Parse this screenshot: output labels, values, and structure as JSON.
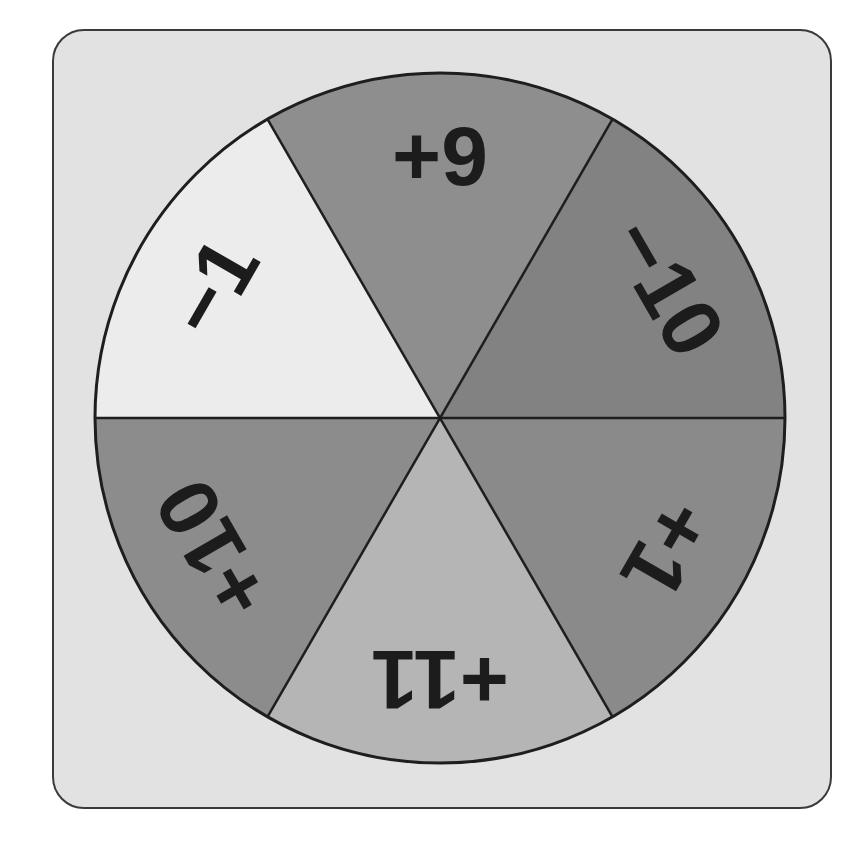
{
  "spinner": {
    "center": {
      "x": 440,
      "y": 418
    },
    "radius": 345,
    "outline_color": "#1e1e1e",
    "card_background": "#e2e2e2",
    "segments": [
      {
        "label": "+9",
        "color": "#8e8e8e",
        "start_angle": -120,
        "end_angle": -60,
        "label_rotation": 0
      },
      {
        "label": "−10",
        "color": "#828282",
        "start_angle": -60,
        "end_angle": 0,
        "label_rotation": 60
      },
      {
        "label": "+1",
        "color": "#8a8a8a",
        "start_angle": 0,
        "end_angle": 60,
        "label_rotation": 120
      },
      {
        "label": "+11",
        "color": "#b5b5b5",
        "start_angle": 60,
        "end_angle": 120,
        "label_rotation": 180
      },
      {
        "label": "+10",
        "color": "#8c8c8c",
        "start_angle": 120,
        "end_angle": 180,
        "label_rotation": 240
      },
      {
        "label": "−1",
        "color": "#ececec",
        "start_angle": 180,
        "end_angle": 240,
        "label_rotation": 300
      }
    ]
  }
}
